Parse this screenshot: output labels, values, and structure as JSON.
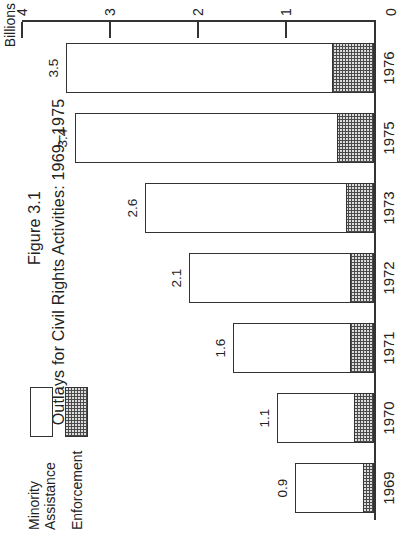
{
  "colors": {
    "ink": "#333333",
    "paper": "#ffffff",
    "hatch_dark": "#4a4a4a",
    "hatch_light": "#dcdcdc"
  },
  "chart_data": {
    "type": "bar",
    "subtype": "stacked-vertical",
    "title_line1": "Figure 3.1",
    "title_line2": "Outlays for Civil Rights Activities: 1969–1975",
    "axis_unit_label": "Billions",
    "ylim": [
      0,
      4
    ],
    "yticks": [
      4,
      3,
      2,
      1,
      0
    ],
    "ytick_labels": [
      "4",
      "3",
      "2",
      "1",
      "0"
    ],
    "categories": [
      "1969",
      "1970",
      "1971",
      "1972",
      "1973",
      "1975",
      "1976"
    ],
    "totals": [
      0.9,
      1.1,
      1.6,
      2.1,
      2.6,
      3.4,
      3.5
    ],
    "total_labels": [
      "0.9",
      "1.1",
      "1.6",
      "2.1",
      "2.6",
      "3.4",
      "3.5"
    ],
    "series": [
      {
        "name": "Minority Assistance",
        "style": "white",
        "values": [
          0.8,
          0.9,
          1.35,
          1.85,
          2.3,
          3.0,
          3.05
        ]
      },
      {
        "name": "Enforcement",
        "style": "crosshatch",
        "values": [
          0.1,
          0.2,
          0.25,
          0.25,
          0.3,
          0.4,
          0.45
        ]
      }
    ],
    "legend": [
      {
        "label": "Minority Assistance",
        "swatch": "white"
      },
      {
        "label": "Enforcement",
        "swatch": "crosshatch"
      }
    ],
    "note": "Enforcement/Minority split estimated from hatched segment extents; totals are the printed bar labels."
  }
}
